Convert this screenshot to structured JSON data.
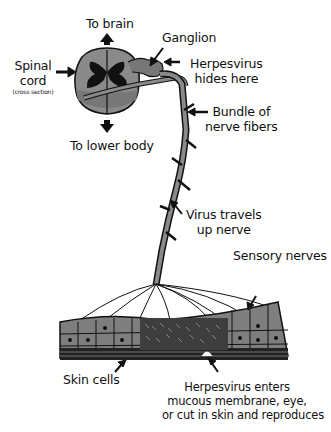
{
  "diagram": {
    "type": "biological illustration",
    "labels": {
      "to_brain": "To brain",
      "ganglion": "Ganglion",
      "spinal_cord": [
        "Spinal",
        "cord"
      ],
      "spinal_cord_note": "(cross section)",
      "herpes_hides": [
        "Herpesvirus",
        "hides here"
      ],
      "to_lower_body": "To lower body",
      "bundle": [
        "Bundle of",
        "nerve fibers"
      ],
      "virus_travels": [
        "Virus travels",
        "up nerve"
      ],
      "sensory_nerves": "Sensory nerves",
      "skin_cells": "Skin cells",
      "herpes_enters": [
        "Herpesvirus enters",
        "mucous membrane, eye,",
        "or cut in skin and reproduces"
      ]
    },
    "colors": {
      "ink": "#111111",
      "tissue_gray": "#8a8a8a",
      "dark_gray": "#4a4a4a",
      "background": "#ffffff"
    }
  }
}
